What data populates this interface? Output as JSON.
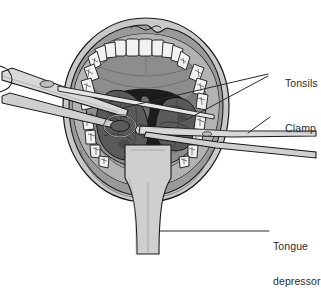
{
  "illustration": {
    "title": "Tonsillectomy procedure view of open mouth",
    "subject": "open mouth with tonsils, clamp and tongue depressor"
  },
  "labels": [
    {
      "id": "tonsils",
      "text": "Tonsils",
      "leader": "double-line"
    },
    {
      "id": "clamp",
      "text": "Clamp",
      "leader": "diagonal-line"
    },
    {
      "id": "depressor",
      "line1": "Tongue",
      "line2": "depressor",
      "leader": "horizontal-line"
    }
  ],
  "anatomy": {
    "lips": "lips",
    "upper_teeth": "upper-teeth-arch",
    "lower_teeth": "lower-teeth-arch",
    "hard_palate": "hard-palate",
    "soft_palate": "soft-palate",
    "uvula": "uvula",
    "left_tonsil": "left-tonsil",
    "right_tonsil": "right-tonsil",
    "pharynx": "oropharynx",
    "tongue": "tongue"
  },
  "instruments": {
    "clamp": "surgical-clamp",
    "depressor": "tongue-depressor"
  },
  "colors": {
    "outline": "#1a1a1a",
    "label_text": "#2b2b2b",
    "lip": "#9a9a9a",
    "lip_light": "#bdbdbd",
    "skin": "#c9c9c9",
    "teeth": "#f2f2f2",
    "palate": "#8d8d8d",
    "palate_dark": "#7a7a7a",
    "tonsil": "#5a5a5a",
    "pharynx": "#1c1c1c",
    "tongue": "#a8a8a8",
    "metal": "#d8d8d8",
    "metal_shade": "#8e8e8e",
    "background": "#ffffff"
  }
}
